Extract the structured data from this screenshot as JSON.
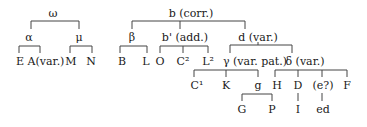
{
  "diagram": {
    "type": "stemma",
    "nodes": {
      "omega": {
        "label": "ω",
        "x": 53,
        "y": 8
      },
      "alpha": {
        "label": "α",
        "x": 29,
        "y": 32
      },
      "mu": {
        "label": "μ",
        "x": 79,
        "y": 32
      },
      "E": {
        "label": "E",
        "x": 20,
        "y": 56
      },
      "A": {
        "label": "A(var.)",
        "x": 46,
        "y": 56
      },
      "M": {
        "label": "M",
        "x": 71,
        "y": 56
      },
      "N": {
        "label": "N",
        "x": 91,
        "y": 56
      },
      "b": {
        "label": "b (corr.)",
        "x": 191,
        "y": 8
      },
      "beta": {
        "label": "β",
        "x": 132,
        "y": 32
      },
      "bprime": {
        "label": "b' (add.)",
        "x": 185,
        "y": 32
      },
      "d": {
        "label": "d (var.)",
        "x": 258,
        "y": 32
      },
      "B": {
        "label": "B",
        "x": 122,
        "y": 56
      },
      "L": {
        "label": "L",
        "x": 146,
        "y": 56
      },
      "O": {
        "label": "O",
        "x": 160,
        "y": 56
      },
      "C2": {
        "label": "C²",
        "x": 183,
        "y": 56
      },
      "L2": {
        "label": "L²",
        "x": 208,
        "y": 56
      },
      "gamma": {
        "label": "γ (var. pat.)",
        "x": 255,
        "y": 56
      },
      "delta": {
        "label": "δ (var.)",
        "x": 305,
        "y": 56
      },
      "C1": {
        "label": "C¹",
        "x": 197,
        "y": 80
      },
      "K": {
        "label": "K",
        "x": 226,
        "y": 80
      },
      "g": {
        "label": "g",
        "x": 258,
        "y": 80
      },
      "H": {
        "label": "H",
        "x": 277,
        "y": 80
      },
      "D": {
        "label": "D",
        "x": 298,
        "y": 80
      },
      "e": {
        "label": "(e?)",
        "x": 323,
        "y": 80
      },
      "F": {
        "label": "F",
        "x": 347,
        "y": 80
      },
      "G": {
        "label": "G",
        "x": 242,
        "y": 104
      },
      "P": {
        "label": "P",
        "x": 272,
        "y": 104
      },
      "I": {
        "label": "I",
        "x": 298,
        "y": 104
      },
      "ed": {
        "label": "ed",
        "x": 323,
        "y": 104
      }
    },
    "edges": [
      [
        "omega",
        "alpha"
      ],
      [
        "omega",
        "mu"
      ],
      [
        "alpha",
        "E"
      ],
      [
        "alpha",
        "A"
      ],
      [
        "mu",
        "M"
      ],
      [
        "mu",
        "N"
      ],
      [
        "b",
        "beta"
      ],
      [
        "b",
        "bprime"
      ],
      [
        "b",
        "d"
      ],
      [
        "beta",
        "B"
      ],
      [
        "beta",
        "L"
      ],
      [
        "bprime",
        "O"
      ],
      [
        "bprime",
        "C2"
      ],
      [
        "bprime",
        "L2"
      ],
      [
        "d",
        "gamma"
      ],
      [
        "d",
        "delta"
      ],
      [
        "gamma",
        "C1"
      ],
      [
        "gamma",
        "K"
      ],
      [
        "gamma",
        "g"
      ],
      [
        "delta",
        "H"
      ],
      [
        "delta",
        "D"
      ],
      [
        "delta",
        "e"
      ],
      [
        "delta",
        "F"
      ],
      [
        "g",
        "G"
      ],
      [
        "g",
        "P"
      ],
      [
        "D",
        "I"
      ],
      [
        "e",
        "ed"
      ]
    ]
  }
}
